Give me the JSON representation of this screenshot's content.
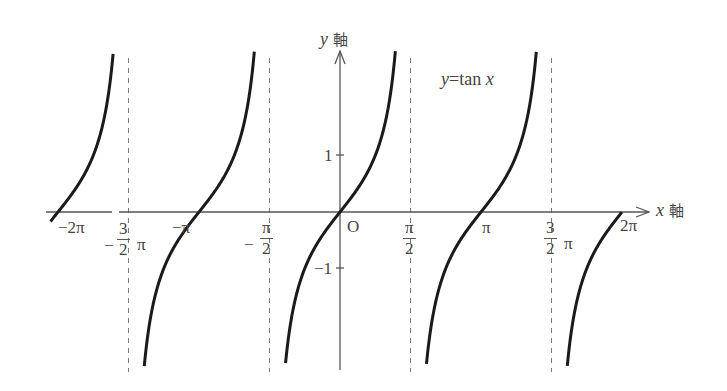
{
  "chart_data": {
    "type": "line",
    "title": "y=tan x",
    "function": "y = tan x",
    "xlabel": "x 軸",
    "ylabel": "y 軸",
    "x_range": [
      -6.7,
      6.6
    ],
    "y_range": [
      -2.7,
      2.9
    ],
    "x_ticks": [
      {
        "value": -6.2832,
        "label": "−2π"
      },
      {
        "value": -4.7124,
        "label": "−3/2 π"
      },
      {
        "value": -3.1416,
        "label": "−π"
      },
      {
        "value": -1.5708,
        "label": "−π/2"
      },
      {
        "value": 0,
        "label": "O"
      },
      {
        "value": 1.5708,
        "label": "π/2"
      },
      {
        "value": 3.1416,
        "label": "π"
      },
      {
        "value": 4.7124,
        "label": "3/2 π"
      },
      {
        "value": 6.2832,
        "label": "2π"
      }
    ],
    "y_ticks": [
      {
        "value": 1,
        "label": "1"
      },
      {
        "value": -1,
        "label": "−1"
      }
    ],
    "asymptotes": [
      -4.7124,
      -1.5708,
      1.5708,
      4.7124
    ],
    "asymptote_style": "dashed",
    "grid": false,
    "legend": null,
    "series": [
      {
        "name": "tan x",
        "branches": [
          {
            "x_from": -6.45,
            "x_to": -4.77
          },
          {
            "x_from": -4.62,
            "x_to": -3.14
          },
          {
            "x_from": -3.14,
            "x_to": -1.63
          },
          {
            "x_from": -1.5,
            "x_to": 1.52
          },
          {
            "x_from": 1.64,
            "x_to": 4.66
          },
          {
            "x_from": 4.77,
            "x_to": 6.28
          }
        ]
      }
    ]
  },
  "labels": {
    "x_axis": "x",
    "x_axis_suffix": "軸",
    "y_axis": "y",
    "y_axis_suffix": "軸",
    "equation_y": "y",
    "equation_eq": "=tan ",
    "equation_x": "x",
    "origin": "O",
    "neg_two_pi": "−2π",
    "neg_three_half_pi_sign": "−",
    "neg_three_half_pi_num": "3",
    "neg_three_half_pi_den": "2",
    "neg_three_half_pi_pi": "π",
    "neg_pi": "−π",
    "neg_half_pi_sign": "−",
    "neg_half_pi_num": "π",
    "neg_half_pi_den": "2",
    "half_pi_num": "π",
    "half_pi_den": "2",
    "pi": "π",
    "three_half_pi_num": "3",
    "three_half_pi_den": "2",
    "three_half_pi_pi": "π",
    "two_pi": "2π",
    "y_one": "1",
    "y_neg_one": "−1"
  },
  "colors": {
    "curve": "#1a1a1a",
    "axis": "#555555",
    "asymptote": "#777777",
    "text": "#444444"
  }
}
